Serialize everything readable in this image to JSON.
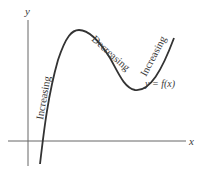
{
  "diagram": {
    "axes": {
      "x_label": "x",
      "y_label": "y"
    },
    "function_label": "y = f(x)",
    "segments": [
      {
        "label": "Increasing",
        "position": "left rising branch"
      },
      {
        "label": "Decreasing",
        "position": "middle falling branch"
      },
      {
        "label": "Increasing",
        "position": "right rising branch"
      }
    ],
    "colors": {
      "axes": "#555555",
      "curve": "#333333",
      "text": "#3a3a3a"
    }
  }
}
